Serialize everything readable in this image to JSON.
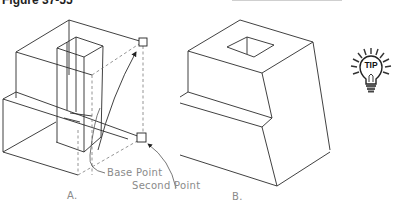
{
  "figure": {
    "title": "Figure 37-55"
  },
  "drawing_a": {
    "label": "A.",
    "callouts": {
      "base_point": "Base Point",
      "second_point": "Second Point"
    }
  },
  "drawing_b": {
    "label": "B."
  },
  "tip_icon": {
    "text": "TIP"
  },
  "colors": {
    "line": "#2b2b2b",
    "hidden_line": "#7a7a7a",
    "label_text": "#8a8a8a"
  }
}
